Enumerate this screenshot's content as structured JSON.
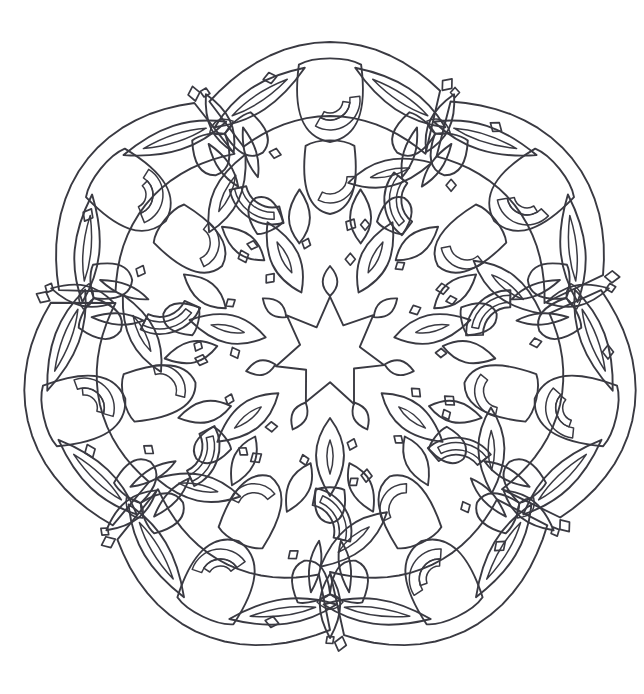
{
  "artwork": {
    "title": "Floral Mandala Coloring Page",
    "type": "line-art",
    "style": "coloring-book outline",
    "symmetry": "7-fold rotational",
    "symmetry_count": 7,
    "center_x": 330,
    "center_y": 352,
    "background_color": "#ffffff",
    "line_color": "#3a3a42",
    "line_width": 1.9,
    "canvas_width": 644,
    "canvas_height": 694,
    "extent": {
      "left": 35,
      "right": 612,
      "top": 50,
      "bottom": 652
    }
  },
  "motifs": {
    "center": {
      "name": "seven-pointed-star",
      "points": 7,
      "outer_radius": 57,
      "inner_radius": 29
    },
    "ring_inner": {
      "name": "inner-leaf-ring",
      "count": 7,
      "radius": 105,
      "element": "pointed-leaf-with-vein"
    },
    "ring_middle": {
      "name": "middle-bud-ring",
      "count": 7,
      "radius": 175,
      "element": "tulip-bud-and-foliage"
    },
    "ring_outer": {
      "name": "outer-petal-ring",
      "count": 7,
      "radius": 248,
      "element": "petal-lobe-with-ovate-leaves"
    },
    "accents": {
      "name": "scatter-accent-dots",
      "shapes": [
        "diamond",
        "teardrop",
        "eye-oval"
      ],
      "count": 28
    }
  },
  "accent_dots": [
    {
      "label": "top-teardrop",
      "x": 270,
      "y": 78
    },
    {
      "label": "upper-right-diamond",
      "x": 496,
      "y": 127
    },
    {
      "label": "left-eye",
      "x": 88,
      "y": 215
    },
    {
      "label": "right-dot",
      "x": 608,
      "y": 352
    },
    {
      "label": "lower-left-eye",
      "x": 90,
      "y": 451
    },
    {
      "label": "lower-right-diamond",
      "x": 500,
      "y": 546
    },
    {
      "label": "bottom-teardrop",
      "x": 272,
      "y": 622
    }
  ]
}
